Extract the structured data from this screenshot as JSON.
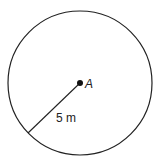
{
  "diagram": {
    "shape": "circle",
    "center_label": "A",
    "radius_label": "5 m",
    "colors": {
      "stroke": "#222222",
      "background": "#ffffff"
    }
  }
}
